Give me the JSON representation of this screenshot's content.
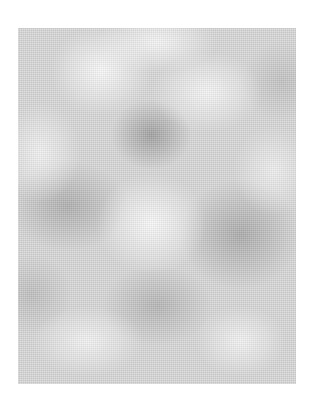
{
  "image": {
    "description": "Abstract grayscale cloud / noise texture on a white background",
    "palette": {
      "background": "#ffffff",
      "texture_base": "#d6d6d6",
      "light_tone": "#f8f8f8",
      "dark_tone": "#969696"
    }
  }
}
